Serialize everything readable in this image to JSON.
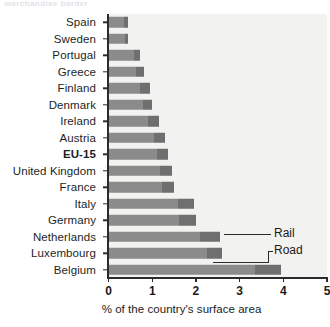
{
  "top_fragment": "merchandise border",
  "chart_data": {
    "type": "bar",
    "orientation": "horizontal",
    "title": "",
    "xlabel": "% of the country's surface area",
    "ylabel": "",
    "xlim": [
      0,
      5
    ],
    "xticks": [
      0,
      1,
      2,
      3,
      4,
      5
    ],
    "xtick_labels": [
      "0",
      "1",
      "2",
      "3",
      "4",
      "5"
    ],
    "grid": false,
    "legend_position": "inline-annotation",
    "stacked": true,
    "categories": [
      "Spain",
      "Sweden",
      "Portugal",
      "Greece",
      "Finland",
      "Denmark",
      "Ireland",
      "Austria",
      "EU-15",
      "United Kingdom",
      "France",
      "Italy",
      "Germany",
      "Netherlands",
      "Luxembourg",
      "Belgium"
    ],
    "highlight_category": "EU-15",
    "series": [
      {
        "name": "Road",
        "color": "#8b8b8b",
        "values": [
          0.36,
          0.38,
          0.58,
          0.62,
          0.72,
          0.78,
          0.9,
          1.05,
          1.1,
          1.18,
          1.22,
          1.6,
          1.62,
          2.1,
          2.25,
          3.35
        ]
      },
      {
        "name": "Rail",
        "color": "#6f6f6f",
        "values": [
          0.09,
          0.07,
          0.14,
          0.18,
          0.23,
          0.22,
          0.25,
          0.25,
          0.27,
          0.27,
          0.28,
          0.35,
          0.38,
          0.45,
          0.35,
          0.6
        ]
      }
    ],
    "totals": [
      0.45,
      0.45,
      0.72,
      0.8,
      0.95,
      1.0,
      1.15,
      1.3,
      1.37,
      1.45,
      1.5,
      1.95,
      2.0,
      2.55,
      2.6,
      3.95
    ],
    "annotations": [
      {
        "label": "Rail",
        "points_to": "Netherlands"
      },
      {
        "label": "Road",
        "points_to": "Luxembourg"
      }
    ]
  }
}
